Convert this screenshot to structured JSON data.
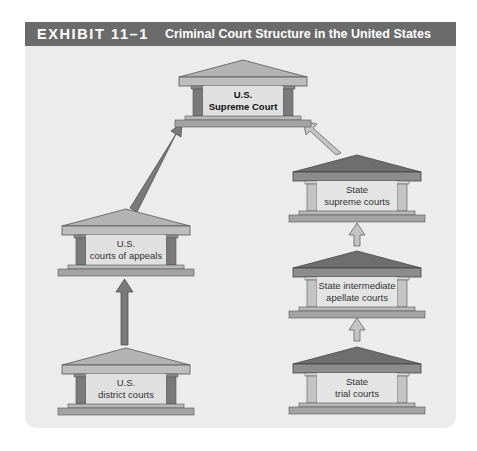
{
  "header": {
    "exhibit_label": "EXHIBIT 11–1",
    "title": "Criminal Court Structure in the United States"
  },
  "courts": {
    "supreme": {
      "line1": "U.S.",
      "line2": "Supreme Court"
    },
    "appeals": {
      "line1": "U.S.",
      "line2": "courts of appeals"
    },
    "district": {
      "line1": "U.S.",
      "line2": "district courts"
    },
    "state_supreme": {
      "line1": "State",
      "line2": "supreme courts"
    },
    "state_intermediate": {
      "line1": "State intermediate",
      "line2": "apellate courts"
    },
    "state_trial": {
      "line1": "State",
      "line2": "trial courts"
    }
  },
  "colors": {
    "header_bg": "#6b6b6b",
    "panel_bg": "#ececec",
    "federal_dark": "#7a7a7a",
    "state_light": "#c4c4c4",
    "roof_federal": "#b3b3b3",
    "roof_state": "#6e6e6e"
  }
}
